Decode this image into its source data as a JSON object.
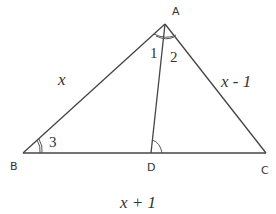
{
  "diagram": {
    "type": "triangle-with-cevian",
    "vertices": {
      "A": {
        "label": "A",
        "x": 165,
        "y": 24
      },
      "B": {
        "label": "B",
        "x": 23,
        "y": 153
      },
      "C": {
        "label": "C",
        "x": 266,
        "y": 153
      },
      "D": {
        "label": "D",
        "x": 151,
        "y": 153
      }
    },
    "segments": [
      "AB",
      "AC",
      "BC",
      "AD"
    ],
    "side_labels": {
      "AB": "x",
      "AC": "x - 1",
      "BC": "x + 1"
    },
    "angle_labels": {
      "angle1": "1",
      "angle2": "2",
      "angle3": "3"
    },
    "stroke_color": "#444444"
  }
}
